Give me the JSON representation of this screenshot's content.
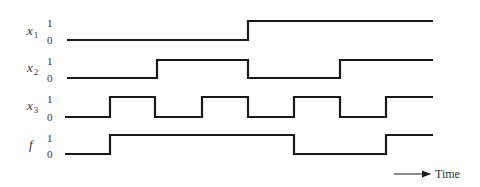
{
  "diagram": {
    "type": "timing-diagram",
    "signals": [
      {
        "name": "x",
        "subscript": "1",
        "high_label": "1",
        "low_label": "0",
        "y_high": 21,
        "y_low": 40,
        "label_y": 35,
        "one_y": 27,
        "zero_y": 44,
        "start_level": 0,
        "transitions": [
          248
        ]
      },
      {
        "name": "x",
        "subscript": "2",
        "high_label": "1",
        "low_label": "0",
        "y_high": 60,
        "y_low": 78,
        "label_y": 72,
        "one_y": 65,
        "zero_y": 82,
        "start_level": 0,
        "transitions": [
          157,
          248,
          340
        ]
      },
      {
        "name": "x",
        "subscript": "3",
        "high_label": "1",
        "low_label": "0",
        "y_high": 97,
        "y_low": 117,
        "label_y": 110,
        "one_y": 103,
        "zero_y": 121,
        "start_level": 0,
        "transitions": [
          110,
          155,
          202,
          248,
          294,
          340,
          386
        ]
      },
      {
        "name": "f",
        "subscript": "",
        "high_label": "1",
        "low_label": "0",
        "y_high": 135,
        "y_low": 154,
        "label_y": 149,
        "one_y": 142,
        "zero_y": 158,
        "start_level": 0,
        "transitions": [
          110,
          294,
          386
        ]
      }
    ],
    "x_start": 67,
    "x_end": 433,
    "time_axis": {
      "label": "Time",
      "arrow_from": 394,
      "arrow_to": 430,
      "y": 174
    }
  }
}
